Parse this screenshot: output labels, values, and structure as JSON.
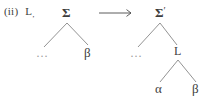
{
  "figure": {
    "case_label": {
      "marker": "(ii)",
      "symbol": "L",
      "subscript": ","
    },
    "relation": {
      "arrow_glyph": "→",
      "name": "rightwards-arrow"
    },
    "left_tree": {
      "root": {
        "label": "Σ",
        "prime": ""
      },
      "left_child": {
        "label": "…"
      },
      "right_child": {
        "label": "β"
      }
    },
    "right_tree": {
      "root": {
        "label": "Σ",
        "prime": "′"
      },
      "left_child": {
        "label": "…"
      },
      "right_child": {
        "label": "L"
      },
      "grandchild_left": {
        "label": "α"
      },
      "grandchild_right": {
        "label": "β"
      }
    },
    "colors": {
      "background": "#ffffff",
      "text": "#3d3d3d",
      "edge": "#6f6f6f",
      "ellipsis": "#9a9a9a"
    }
  }
}
